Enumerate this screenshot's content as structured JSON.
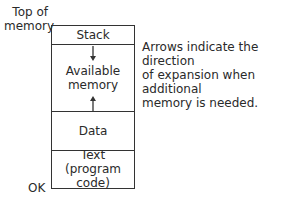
{
  "diagram": {
    "labels": {
      "top": [
        "Top of",
        "memory"
      ],
      "bottom": "OK"
    },
    "segments": [
      {
        "name": "stack",
        "lines": [
          "Stack"
        ]
      },
      {
        "name": "available",
        "lines": [
          "Available",
          "memory"
        ]
      },
      {
        "name": "data",
        "lines": [
          "Data"
        ]
      },
      {
        "name": "text",
        "lines": [
          "Text",
          "(program code)"
        ]
      }
    ],
    "note": [
      "Arrows indicate the direction",
      "of expansion when additional",
      "memory is needed."
    ],
    "colors": {
      "line": "#333333",
      "text": "#2a2a2a",
      "background": "#ffffff"
    }
  }
}
